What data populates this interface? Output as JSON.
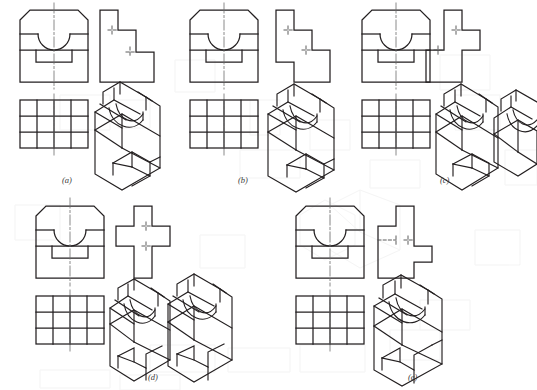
{
  "figure": {
    "background_color": "#ffffff",
    "line_color": "#231f20",
    "centerline_color": "#6d6d6d",
    "hidden_line_color": "#4a4a4a",
    "ghost_color": "#b9b9b9",
    "caption_color": "#3a3a3a"
  },
  "panels": [
    {
      "id": "a",
      "caption": "(a)",
      "views": [
        {
          "name": "front-view",
          "description": "chamfered top corners, semicircular notch, stepped bottom slot"
        },
        {
          "name": "side-view",
          "description": "two-step staircase profile with hidden lines"
        },
        {
          "name": "top-view",
          "description": "rectangular grid 4 columns by 3 rows with centerlines"
        },
        {
          "name": "isometric-pictorial",
          "description": "block with U-shaped saddle and front step"
        }
      ]
    },
    {
      "id": "b",
      "caption": "(b)",
      "views": [
        {
          "name": "front-view",
          "description": "chamfered top corners, semicircular notch, stepped bottom slot"
        },
        {
          "name": "side-view",
          "description": "zigzag staircase profile with hidden lines"
        },
        {
          "name": "top-view",
          "description": "rectangular grid 4 columns by 3 rows with centerlines"
        },
        {
          "name": "isometric-pictorial",
          "description": "block with U-shaped saddle and front step"
        }
      ]
    },
    {
      "id": "c",
      "caption": "(c)",
      "views": [
        {
          "name": "front-view",
          "description": "chamfered top corners, semicircular notch, stepped bottom slot"
        },
        {
          "name": "side-view",
          "description": "profile with upper tab and left side protrusion"
        },
        {
          "name": "top-view",
          "description": "rectangular grid 4 columns by 3 rows with centerlines"
        },
        {
          "name": "isometric-pictorial",
          "description": "block with U-shaped saddle"
        }
      ]
    },
    {
      "id": "d",
      "caption": "(d)",
      "views": [
        {
          "name": "front-view",
          "description": "chamfered top corners, semicircular notch, stepped bottom slot"
        },
        {
          "name": "side-view",
          "description": "cross / plus shaped profile"
        },
        {
          "name": "top-view",
          "description": "rectangular grid 4 columns by 3 rows with centerlines"
        },
        {
          "name": "isometric-pictorial",
          "description": "block with U-shaped saddle and notched front"
        }
      ]
    },
    {
      "id": "e",
      "caption": "(e)",
      "views": [
        {
          "name": "front-view",
          "description": "chamfered top corners, semicircular notch, stepped bottom slot"
        },
        {
          "name": "side-view",
          "description": "rectangle with top tab and right lower protrusion"
        },
        {
          "name": "top-view",
          "description": "rectangular grid 4 columns by 3 rows with centerlines"
        },
        {
          "name": "isometric-pictorial",
          "description": "block with U-shaped saddle and front notch"
        }
      ]
    }
  ],
  "top_view_grid": {
    "columns": 4,
    "rows": 3
  }
}
